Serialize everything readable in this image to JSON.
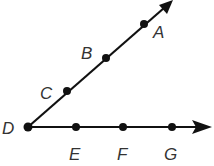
{
  "diagram": {
    "type": "geometry-rays",
    "colors": {
      "stroke": "#111111",
      "label": "#333333"
    },
    "vertex": {
      "id": "D",
      "label": "D",
      "x": 28,
      "y": 127
    },
    "rays": [
      {
        "id": "ray-DA",
        "from": "D",
        "through": [
          "C",
          "B",
          "A"
        ],
        "arrow_tip": {
          "x": 172,
          "y": 0
        }
      },
      {
        "id": "ray-DG",
        "from": "D",
        "through": [
          "E",
          "F",
          "G"
        ],
        "arrow_tip": {
          "x": 211,
          "y": 127
        }
      }
    ],
    "points": [
      {
        "id": "A",
        "label": "A",
        "x": 144,
        "y": 24,
        "label_x": 153,
        "label_y": 38
      },
      {
        "id": "B",
        "label": "B",
        "x": 106,
        "y": 58,
        "label_x": 81,
        "label_y": 59
      },
      {
        "id": "C",
        "label": "C",
        "x": 67,
        "y": 91,
        "label_x": 40,
        "label_y": 99
      },
      {
        "id": "D",
        "label": "D",
        "x": 28,
        "y": 127,
        "label_x": 2,
        "label_y": 134
      },
      {
        "id": "E",
        "label": "E",
        "x": 76,
        "y": 127,
        "label_x": 69,
        "label_y": 160
      },
      {
        "id": "F",
        "label": "F",
        "x": 123,
        "y": 127,
        "label_x": 117,
        "label_y": 160
      },
      {
        "id": "G",
        "label": "G",
        "x": 172,
        "y": 127,
        "label_x": 164,
        "label_y": 160
      }
    ]
  }
}
